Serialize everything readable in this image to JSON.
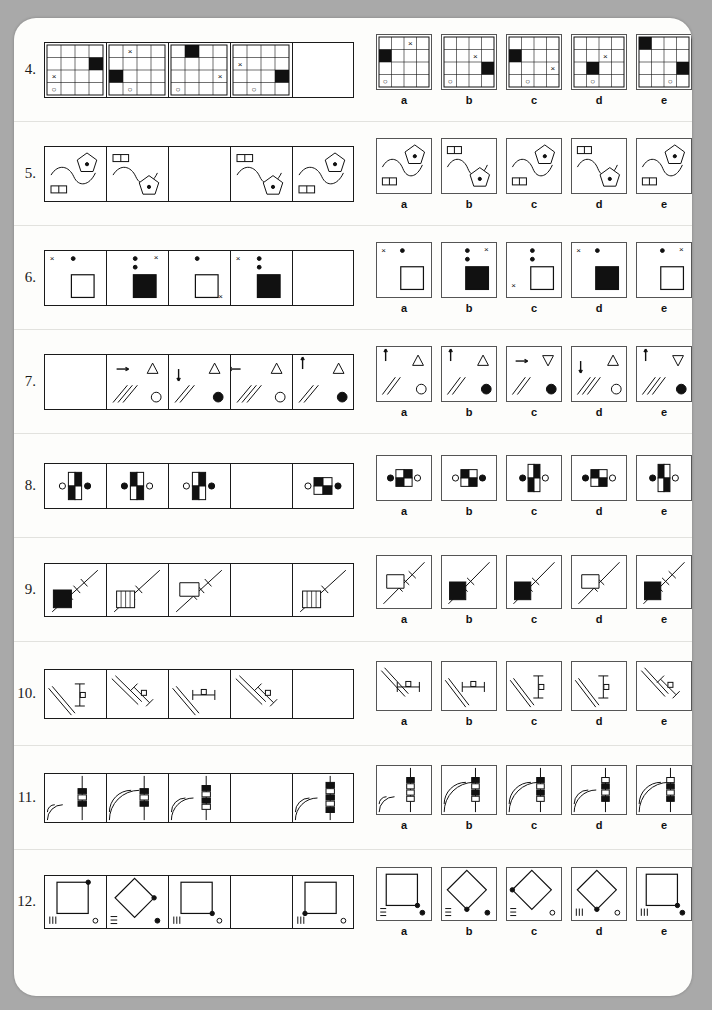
{
  "page": {
    "background": "#a9a9a9",
    "paper": "#fdfdfb",
    "type": "non-verbal-reasoning-test"
  },
  "option_labels": [
    "a",
    "b",
    "c",
    "d",
    "e"
  ],
  "questions": [
    {
      "number": "4.",
      "kind": "grid4x4",
      "sequence": [
        {
          "black": [
            [
              1,
              3
            ]
          ],
          "x": [
            [
              2,
              0
            ]
          ],
          "o": [
            [
              3,
              0
            ]
          ]
        },
        {
          "black": [
            [
              2,
              0
            ]
          ],
          "x": [
            [
              0,
              1
            ]
          ],
          "o": [
            [
              3,
              1
            ]
          ]
        },
        {
          "black": [
            [
              0,
              1
            ]
          ],
          "x": [
            [
              2,
              3
            ]
          ],
          "o": [
            [
              3,
              0
            ]
          ]
        },
        {
          "black": [
            [
              2,
              3
            ]
          ],
          "x": [
            [
              1,
              0
            ]
          ],
          "o": [
            [
              3,
              1
            ]
          ]
        },
        {
          "blank": true
        }
      ],
      "options": [
        {
          "black": [
            [
              1,
              0
            ]
          ],
          "x": [
            [
              0,
              2
            ]
          ],
          "o": [
            [
              3,
              0
            ]
          ]
        },
        {
          "black": [
            [
              2,
              3
            ]
          ],
          "x": [
            [
              1,
              2
            ]
          ],
          "o": [
            [
              3,
              0
            ]
          ]
        },
        {
          "black": [
            [
              1,
              0
            ]
          ],
          "x": [
            [
              2,
              3
            ]
          ],
          "o": [
            [
              3,
              1
            ]
          ]
        },
        {
          "black": [
            [
              2,
              1
            ]
          ],
          "x": [
            [
              1,
              2
            ]
          ],
          "o": [
            [
              3,
              1
            ]
          ]
        },
        {
          "black": [
            [
              0,
              0
            ],
            [
              2,
              3
            ]
          ],
          "x": [],
          "o": [
            [
              3,
              2
            ]
          ]
        }
      ]
    },
    {
      "number": "5.",
      "kind": "pentagon",
      "sequence": [
        {
          "pent": "tr",
          "bar": "bl",
          "curve": "s1"
        },
        {
          "pent": "br",
          "bar": "tl",
          "curve": "s1"
        },
        {
          "blank": true
        },
        {
          "pent": "br",
          "bar": "tl",
          "curve": "s2"
        },
        {
          "pent": "tr",
          "bar": "bl",
          "curve": "s1"
        }
      ],
      "options": [
        {
          "pent": "tr",
          "bar": "bl",
          "curve": "s1"
        },
        {
          "pent": "br",
          "bar": "tl",
          "curve": "s1"
        },
        {
          "pent": "tr",
          "bar": "bl",
          "curve": "s1"
        },
        {
          "pent": "br",
          "bar": "tl",
          "curve": "s1"
        },
        {
          "pent": "tr",
          "bar": "bl",
          "curve": "s1"
        }
      ]
    },
    {
      "number": "6.",
      "kind": "sqdots",
      "sequence": [
        {
          "dots": 1,
          "filled": false,
          "xtl": true,
          "xtr": false,
          "xbl": false,
          "xbr": false
        },
        {
          "dots": 2,
          "filled": true,
          "xtl": false,
          "xtr": true,
          "xbl": false,
          "xbr": false
        },
        {
          "dots": 1,
          "filled": false,
          "xtl": false,
          "xtr": false,
          "xbl": false,
          "xbr": true
        },
        {
          "dots": 2,
          "filled": true,
          "xtl": true,
          "xtr": false,
          "xbl": false,
          "xbr": false
        },
        {
          "blank": true
        }
      ],
      "options": [
        {
          "dots": 1,
          "filled": false,
          "xtl": true,
          "xtr": false,
          "xbl": false,
          "xbr": false
        },
        {
          "dots": 2,
          "filled": true,
          "xtl": false,
          "xtr": true,
          "xbl": false,
          "xbr": false
        },
        {
          "dots": 2,
          "filled": false,
          "xtl": false,
          "xtr": false,
          "xbl": true,
          "xbr": false
        },
        {
          "dots": 1,
          "filled": true,
          "xtl": true,
          "xtr": false,
          "xbl": false,
          "xbr": false
        },
        {
          "dots": 1,
          "filled": false,
          "xtl": false,
          "xtr": true,
          "xbl": false,
          "xbr": false
        }
      ]
    },
    {
      "number": "7.",
      "kind": "arrows",
      "sequence": [
        {
          "blank": true
        },
        {
          "arrow": "right",
          "tri": "up",
          "stripes": 3,
          "dot": "open"
        },
        {
          "arrow": "down",
          "tri": "up",
          "stripes": 2,
          "dot": "filled"
        },
        {
          "arrow": "left",
          "tri": "up",
          "stripes": 3,
          "dot": "open"
        },
        {
          "arrow": "up",
          "tri": "up",
          "stripes": 2,
          "dot": "filled"
        }
      ],
      "options": [
        {
          "arrow": "up",
          "tri": "up",
          "stripes": 2,
          "dot": "open"
        },
        {
          "arrow": "up",
          "tri": "up",
          "stripes": 2,
          "dot": "filled"
        },
        {
          "arrow": "right",
          "tri": "down",
          "stripes": 2,
          "dot": "filled"
        },
        {
          "arrow": "down",
          "tri": "up",
          "stripes": 3,
          "dot": "open"
        },
        {
          "arrow": "up",
          "tri": "down",
          "stripes": 3,
          "dot": "filled"
        }
      ]
    },
    {
      "number": "8.",
      "kind": "domino",
      "sequence": [
        {
          "orient": "v",
          "pattern": "wb-bw",
          "left": "open",
          "right": "filled"
        },
        {
          "orient": "v",
          "pattern": "bw-wb",
          "left": "filled",
          "right": "open"
        },
        {
          "orient": "v",
          "pattern": "wb-bw",
          "left": "open",
          "right": "filled",
          "small": true
        },
        {
          "blank": true
        },
        {
          "orient": "h",
          "pattern": "bw-wb",
          "left": "open",
          "right": "filled"
        }
      ],
      "options": [
        {
          "orient": "h",
          "pattern": "wb-bw",
          "left": "filled",
          "right": "open"
        },
        {
          "orient": "h",
          "pattern": "bw-wb",
          "left": "open",
          "right": "filled"
        },
        {
          "orient": "v",
          "pattern": "wb-bw",
          "left": "filled",
          "right": "open"
        },
        {
          "orient": "h",
          "pattern": "bw-wb",
          "left": "filled",
          "right": "open"
        },
        {
          "orient": "v",
          "pattern": "bw-wb",
          "left": "filled",
          "right": "open"
        }
      ]
    },
    {
      "number": "9.",
      "kind": "hatch",
      "sequence": [
        {
          "ticks": 3,
          "step": "square",
          "black": true
        },
        {
          "ticks": 2,
          "step": "stairs",
          "black": false
        },
        {
          "ticks": 3,
          "step": "notch",
          "black": false
        },
        {
          "blank": true
        },
        {
          "ticks": 2,
          "step": "stairs",
          "black": false
        }
      ],
      "options": [
        {
          "ticks": 3,
          "step": "notch",
          "black": false
        },
        {
          "ticks": 2,
          "step": "square",
          "black": true
        },
        {
          "ticks": 2,
          "step": "square",
          "black": true
        },
        {
          "ticks": 2,
          "step": "notch",
          "black": false
        },
        {
          "ticks": 3,
          "step": "square",
          "black": true
        }
      ]
    },
    {
      "number": "10.",
      "kind": "ibeam",
      "sequence": [
        {
          "rot": "v",
          "diag": "bl",
          "sq": "mid"
        },
        {
          "rot": "d1",
          "diag": "tl",
          "sq": "mid"
        },
        {
          "rot": "h",
          "diag": "bl",
          "sq": "mid"
        },
        {
          "rot": "d1",
          "diag": "tl",
          "sq": "mid"
        },
        {
          "blank": true
        }
      ],
      "options": [
        {
          "rot": "h",
          "diag": "tl",
          "sq": "mid"
        },
        {
          "rot": "h",
          "diag": "bl",
          "sq": "mid"
        },
        {
          "rot": "v",
          "diag": "bl",
          "sq": "mid"
        },
        {
          "rot": "v",
          "diag": "bl",
          "sq": "mid"
        },
        {
          "rot": "d1",
          "diag": "tl",
          "sq": "mid"
        }
      ]
    },
    {
      "number": "11.",
      "kind": "arcs",
      "sequence": [
        {
          "arc": 1,
          "blocks": 3,
          "fill": "bwb"
        },
        {
          "arc": 3,
          "blocks": 3,
          "fill": "bwb"
        },
        {
          "arc": 2,
          "blocks": 4,
          "fill": "bwbw"
        },
        {
          "blank": true
        },
        {
          "arc": 2,
          "blocks": 5,
          "fill": "bwbwb"
        }
      ],
      "options": [
        {
          "arc": 1,
          "blocks": 4,
          "fill": "bwww"
        },
        {
          "arc": 3,
          "blocks": 4,
          "fill": "bwbw"
        },
        {
          "arc": 3,
          "blocks": 4,
          "fill": "bwbw"
        },
        {
          "arc": 2,
          "blocks": 4,
          "fill": "wbwb"
        },
        {
          "arc": 3,
          "blocks": 4,
          "fill": "wbwb"
        }
      ]
    },
    {
      "number": "12.",
      "kind": "diamond",
      "sequence": [
        {
          "shape": "square",
          "dot": "tr",
          "lines": "vert",
          "circle": "open"
        },
        {
          "shape": "diamond",
          "dot": "right",
          "lines": "horiz",
          "circle": "filled"
        },
        {
          "shape": "square",
          "dot": "br",
          "lines": "vert",
          "circle": "open"
        },
        {
          "blank": true
        },
        {
          "shape": "square",
          "dot": "bl",
          "lines": "vert",
          "circle": "open"
        }
      ],
      "options": [
        {
          "shape": "square",
          "dot": "br",
          "lines": "horiz",
          "circle": "filled"
        },
        {
          "shape": "diamond",
          "dot": "bottom",
          "lines": "horiz",
          "circle": "filled"
        },
        {
          "shape": "diamond",
          "dot": "left",
          "lines": "horiz",
          "circle": "open"
        },
        {
          "shape": "diamond",
          "dot": "bottom",
          "lines": "vert",
          "circle": "open"
        },
        {
          "shape": "square",
          "dot": "br",
          "lines": "vert",
          "circle": "filled"
        }
      ]
    }
  ]
}
